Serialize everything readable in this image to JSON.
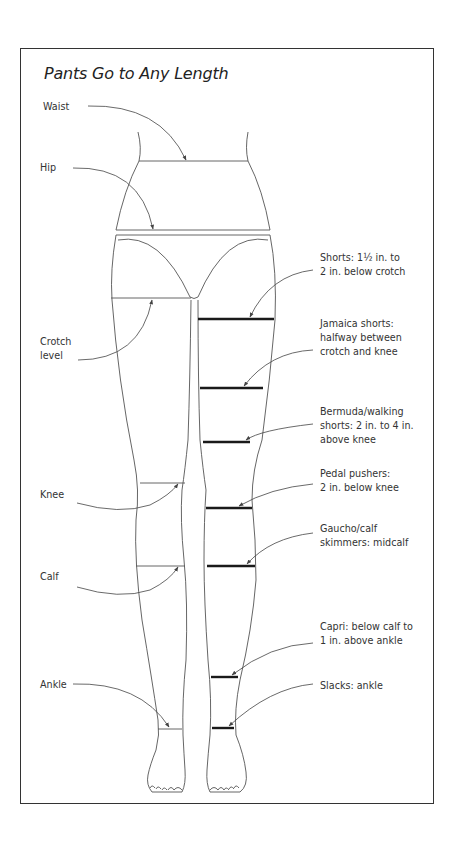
{
  "figure": {
    "title": "Pants Go to Any Length",
    "body_labels": {
      "waist": "Waist",
      "hip": "Hip",
      "crotch_line1": "Crotch",
      "crotch_line2": "level",
      "knee": "Knee",
      "calf": "Calf",
      "ankle": "Ankle"
    },
    "lengths": [
      {
        "name": "shorts",
        "lines": [
          "Shorts: 1½ in. to",
          "2 in. below crotch"
        ]
      },
      {
        "name": "jamaica-shorts",
        "lines": [
          "Jamaica shorts:",
          "halfway between",
          "crotch and knee"
        ]
      },
      {
        "name": "bermuda-walking-shorts",
        "lines": [
          "Bermuda/walking",
          "shorts: 2 in. to 4 in.",
          "above knee"
        ]
      },
      {
        "name": "pedal-pushers",
        "lines": [
          "Pedal pushers:",
          "2 in. below knee"
        ]
      },
      {
        "name": "gaucho-calf-skimmers",
        "lines": [
          "Gaucho/calf",
          "skimmers: midcalf"
        ]
      },
      {
        "name": "capri",
        "lines": [
          "Capri: below calf to",
          "1 in. above ankle"
        ]
      },
      {
        "name": "slacks",
        "lines": [
          "Slacks: ankle"
        ]
      }
    ],
    "colors": {
      "outline": "#555555",
      "hemline": "#1a1a1a",
      "text": "#333333",
      "frame": "#333333"
    }
  }
}
